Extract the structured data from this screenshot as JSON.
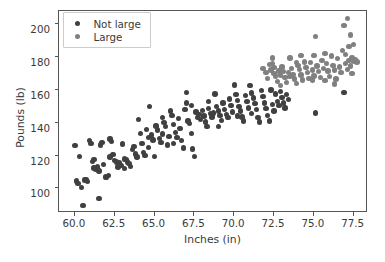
{
  "chart_data": {
    "type": "scatter",
    "title": "",
    "xlabel": "Inches (in)",
    "ylabel": "Pounds (lb)",
    "xlim": [
      59.0,
      78.4
    ],
    "ylim": [
      85.0,
      208.0
    ],
    "xticks": [
      "60.0",
      "62.5",
      "65.0",
      "67.5",
      "70.0",
      "72.5",
      "75.0",
      "77.5"
    ],
    "xtick_values": [
      60.0,
      62.5,
      65.0,
      67.5,
      70.0,
      72.5,
      75.0,
      77.5
    ],
    "yticks": [
      "100",
      "120",
      "140",
      "160",
      "180",
      "200"
    ],
    "ytick_values": [
      100,
      120,
      140,
      160,
      180,
      200
    ],
    "grid": false,
    "legend_position": "upper left",
    "marker_size_px": 5.4,
    "series": [
      {
        "name": "Not large",
        "color": "#404040",
        "points": [
          [
            60.0,
            126.0
          ],
          [
            60.1,
            104.5
          ],
          [
            60.2,
            103.0
          ],
          [
            60.3,
            119.5
          ],
          [
            60.4,
            100.5
          ],
          [
            60.5,
            89.5
          ],
          [
            60.6,
            105.0
          ],
          [
            60.7,
            105.5
          ],
          [
            60.8,
            104.0
          ],
          [
            60.9,
            129.0
          ],
          [
            61.0,
            127.5
          ],
          [
            61.1,
            116.5
          ],
          [
            61.2,
            112.5
          ],
          [
            61.3,
            111.5
          ],
          [
            61.4,
            113.0
          ],
          [
            61.5,
            94.0
          ],
          [
            61.5,
            110.5
          ],
          [
            61.6,
            126.5
          ],
          [
            61.7,
            128.0
          ],
          [
            61.8,
            114.5
          ],
          [
            61.9,
            107.0
          ],
          [
            62.0,
            106.5
          ],
          [
            62.1,
            108.0
          ],
          [
            62.2,
            130.0
          ],
          [
            62.3,
            128.5
          ],
          [
            62.4,
            120.5
          ],
          [
            62.5,
            117.0
          ],
          [
            62.6,
            116.0
          ],
          [
            62.7,
            113.0
          ],
          [
            62.8,
            115.5
          ],
          [
            62.9,
            114.0
          ],
          [
            63.0,
            127.0
          ],
          [
            63.1,
            118.0
          ],
          [
            63.2,
            117.5
          ],
          [
            63.3,
            116.0
          ],
          [
            63.4,
            115.0
          ],
          [
            63.5,
            113.5
          ],
          [
            63.6,
            123.5
          ],
          [
            63.7,
            125.5
          ],
          [
            63.8,
            121.0
          ],
          [
            63.9,
            119.0
          ],
          [
            64.0,
            142.0
          ],
          [
            64.1,
            133.5
          ],
          [
            64.2,
            127.5
          ],
          [
            64.3,
            122.0
          ],
          [
            64.4,
            120.0
          ],
          [
            64.5,
            136.0
          ],
          [
            64.6,
            131.0
          ],
          [
            64.7,
            150.0
          ],
          [
            64.8,
            132.5
          ],
          [
            64.9,
            129.5
          ],
          [
            65.0,
            119.5
          ],
          [
            65.1,
            138.0
          ],
          [
            65.2,
            135.5
          ],
          [
            65.3,
            130.5
          ],
          [
            65.4,
            128.0
          ],
          [
            65.5,
            133.0
          ],
          [
            65.6,
            140.0
          ],
          [
            65.7,
            137.5
          ],
          [
            65.8,
            126.5
          ],
          [
            65.9,
            131.5
          ],
          [
            66.0,
            147.0
          ],
          [
            66.1,
            144.5
          ],
          [
            66.2,
            139.0
          ],
          [
            66.3,
            134.0
          ],
          [
            66.4,
            131.0
          ],
          [
            66.5,
            142.5
          ],
          [
            66.6,
            136.5
          ],
          [
            66.7,
            129.0
          ],
          [
            66.8,
            124.5
          ],
          [
            66.9,
            148.0
          ],
          [
            67.0,
            158.5
          ],
          [
            67.0,
            152.0
          ],
          [
            67.1,
            141.0
          ],
          [
            67.2,
            139.5
          ],
          [
            67.3,
            133.5
          ],
          [
            67.4,
            124.0
          ],
          [
            67.5,
            119.5
          ],
          [
            67.6,
            146.5
          ],
          [
            67.7,
            143.0
          ],
          [
            67.8,
            145.0
          ],
          [
            67.9,
            142.0
          ],
          [
            68.0,
            147.5
          ],
          [
            68.1,
            144.0
          ],
          [
            68.2,
            140.5
          ],
          [
            68.3,
            137.5
          ],
          [
            68.4,
            148.5
          ],
          [
            68.5,
            145.5
          ],
          [
            68.6,
            143.5
          ],
          [
            68.7,
            146.0
          ],
          [
            68.8,
            157.5
          ],
          [
            68.9,
            150.0
          ],
          [
            69.0,
            147.0
          ],
          [
            69.1,
            144.5
          ],
          [
            69.2,
            141.5
          ],
          [
            69.3,
            152.0
          ],
          [
            69.4,
            148.0
          ],
          [
            69.5,
            145.0
          ],
          [
            69.6,
            143.0
          ],
          [
            69.7,
            154.5
          ],
          [
            69.8,
            150.5
          ],
          [
            69.9,
            146.5
          ],
          [
            70.0,
            163.0
          ],
          [
            70.1,
            157.0
          ],
          [
            70.2,
            153.5
          ],
          [
            70.3,
            150.0
          ],
          [
            70.4,
            147.0
          ],
          [
            70.5,
            143.5
          ],
          [
            70.6,
            141.0
          ],
          [
            70.7,
            156.5
          ],
          [
            70.8,
            153.0
          ],
          [
            70.9,
            149.0
          ],
          [
            71.0,
            162.5
          ],
          [
            71.1,
            158.0
          ],
          [
            71.2,
            155.0
          ],
          [
            71.3,
            151.5
          ],
          [
            71.4,
            148.0
          ],
          [
            71.5,
            143.0
          ],
          [
            71.6,
            140.5
          ],
          [
            71.7,
            159.5
          ],
          [
            71.8,
            156.0
          ],
          [
            71.9,
            152.0
          ],
          [
            72.0,
            148.5
          ],
          [
            72.1,
            144.5
          ],
          [
            72.2,
            141.0
          ],
          [
            72.3,
            160.0
          ],
          [
            72.4,
            151.0
          ],
          [
            72.5,
            147.0
          ],
          [
            72.6,
            157.5
          ],
          [
            72.7,
            153.0
          ],
          [
            72.8,
            150.5
          ],
          [
            72.9,
            159.0
          ],
          [
            73.0,
            155.5
          ],
          [
            73.1,
            152.0
          ],
          [
            73.2,
            149.0
          ],
          [
            73.3,
            157.0
          ],
          [
            73.4,
            154.0
          ],
          [
            75.1,
            146.0
          ],
          [
            76.9,
            158.5
          ],
          [
            69.0,
            137.5
          ],
          [
            70.2,
            144.0
          ],
          [
            71.1,
            145.5
          ],
          [
            68.4,
            153.0
          ],
          [
            66.2,
            127.5
          ],
          [
            64.6,
            125.0
          ],
          [
            63.1,
            112.0
          ],
          [
            62.2,
            119.0
          ],
          [
            61.2,
            117.5
          ],
          [
            65.5,
            143.0
          ],
          [
            67.3,
            150.5
          ]
        ]
      },
      {
        "name": "Large",
        "color": "#808080",
        "points": [
          [
            72.2,
            175.5
          ],
          [
            72.3,
            172.0
          ],
          [
            72.4,
            179.5
          ],
          [
            72.4,
            176.0
          ],
          [
            72.5,
            173.5
          ],
          [
            72.5,
            170.0
          ],
          [
            72.6,
            168.5
          ],
          [
            72.7,
            165.0
          ],
          [
            72.8,
            171.5
          ],
          [
            72.9,
            169.0
          ],
          [
            73.0,
            174.0
          ],
          [
            73.1,
            171.0
          ],
          [
            73.2,
            167.5
          ],
          [
            73.3,
            164.5
          ],
          [
            73.4,
            170.5
          ],
          [
            73.5,
            168.0
          ],
          [
            73.6,
            173.0
          ],
          [
            73.7,
            169.5
          ],
          [
            73.8,
            166.5
          ],
          [
            73.9,
            164.0
          ],
          [
            74.0,
            175.0
          ],
          [
            74.1,
            172.5
          ],
          [
            74.2,
            169.0
          ],
          [
            74.3,
            166.0
          ],
          [
            74.4,
            177.0
          ],
          [
            74.5,
            173.5
          ],
          [
            74.6,
            170.5
          ],
          [
            74.7,
            167.0
          ],
          [
            74.8,
            176.5
          ],
          [
            74.9,
            172.0
          ],
          [
            75.0,
            181.0
          ],
          [
            75.0,
            168.5
          ],
          [
            75.1,
            192.5
          ],
          [
            75.2,
            174.5
          ],
          [
            75.3,
            171.0
          ],
          [
            75.4,
            167.5
          ],
          [
            75.5,
            178.0
          ],
          [
            75.6,
            173.0
          ],
          [
            75.7,
            165.5
          ],
          [
            75.8,
            176.0
          ],
          [
            75.9,
            171.5
          ],
          [
            76.0,
            168.0
          ],
          [
            76.1,
            180.5
          ],
          [
            76.2,
            175.0
          ],
          [
            76.3,
            172.0
          ],
          [
            76.4,
            166.5
          ],
          [
            76.5,
            179.0
          ],
          [
            76.6,
            174.0
          ],
          [
            76.7,
            170.5
          ],
          [
            76.8,
            184.0
          ],
          [
            76.9,
            199.0
          ],
          [
            77.0,
            181.5
          ],
          [
            77.0,
            176.0
          ],
          [
            77.1,
            203.5
          ],
          [
            77.1,
            172.5
          ],
          [
            77.2,
            186.5
          ],
          [
            77.2,
            178.0
          ],
          [
            77.3,
            193.5
          ],
          [
            77.3,
            174.5
          ],
          [
            77.4,
            179.5
          ],
          [
            77.4,
            170.0
          ],
          [
            77.5,
            187.5
          ],
          [
            77.5,
            177.5
          ],
          [
            77.6,
            178.5
          ],
          [
            77.7,
            177.0
          ],
          [
            71.8,
            173.0
          ],
          [
            72.0,
            170.5
          ],
          [
            72.1,
            167.0
          ],
          [
            73.5,
            179.5
          ],
          [
            74.2,
            181.0
          ],
          [
            74.9,
            166.0
          ],
          [
            75.7,
            182.0
          ],
          [
            76.3,
            163.5
          ],
          [
            73.9,
            176.5
          ],
          [
            72.9,
            162.5
          ]
        ]
      }
    ]
  }
}
